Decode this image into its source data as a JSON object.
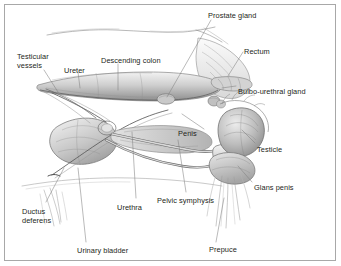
{
  "figure": {
    "style": "pencil-shaded anatomical illustration",
    "border_color": "#a8a8a8",
    "label_color": "#231f20",
    "leader_color": "#6f6f6f",
    "background": "#ffffff"
  },
  "labels": [
    {
      "id": "prostate-gland",
      "text": "Prostate gland",
      "x": 208,
      "y": 11,
      "align": "left"
    },
    {
      "id": "rectum",
      "text": "Rectum",
      "x": 244,
      "y": 47,
      "align": "left"
    },
    {
      "id": "bulbo-urethral",
      "text": "Bulbo-urethral gland",
      "x": 238,
      "y": 87,
      "align": "left"
    },
    {
      "id": "testicular-vessels",
      "text": "Testicular\nvessels",
      "x": 17,
      "y": 52,
      "align": "left"
    },
    {
      "id": "ureter",
      "text": "Ureter",
      "x": 64,
      "y": 66,
      "align": "left"
    },
    {
      "id": "descending-colon",
      "text": "Descending colon",
      "x": 101,
      "y": 56,
      "align": "left"
    },
    {
      "id": "penis",
      "text": "Penis",
      "x": 178,
      "y": 129,
      "align": "left"
    },
    {
      "id": "testicle",
      "text": "Testicle",
      "x": 257,
      "y": 145,
      "align": "left"
    },
    {
      "id": "glans-penis",
      "text": "Glans penis",
      "x": 254,
      "y": 183,
      "align": "left"
    },
    {
      "id": "pelvic-symphysis",
      "text": "Pelvic symphysis",
      "x": 157,
      "y": 196,
      "align": "left"
    },
    {
      "id": "urethra",
      "text": "Urethra",
      "x": 117,
      "y": 203,
      "align": "left"
    },
    {
      "id": "ductus-deferens",
      "text": "Ductus\ndeferens",
      "x": 22,
      "y": 207,
      "align": "left"
    },
    {
      "id": "urinary-bladder",
      "text": "Urinary bladder",
      "x": 77,
      "y": 246,
      "align": "left"
    },
    {
      "id": "prepuce",
      "text": "Prepuce",
      "x": 209,
      "y": 245,
      "align": "left"
    }
  ],
  "structures": [
    "dorsal body contour",
    "descending colon",
    "rectum",
    "prostate gland",
    "bulbo-urethral gland",
    "urinary bladder",
    "ureter",
    "ductus deferens",
    "testicular vessels",
    "penis with sigmoid flexure",
    "pelvic symphysis",
    "testicle",
    "glans penis",
    "prepuce"
  ]
}
